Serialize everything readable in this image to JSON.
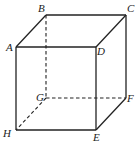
{
  "diagram": {
    "type": "cube",
    "vertices": {
      "A": {
        "x": 16,
        "y": 47,
        "label": "A",
        "lx": 6,
        "ly": 51
      },
      "B": {
        "x": 46,
        "y": 15,
        "label": "B",
        "lx": 38,
        "ly": 12
      },
      "C": {
        "x": 126,
        "y": 15,
        "label": "C",
        "lx": 127,
        "ly": 12
      },
      "D": {
        "x": 96,
        "y": 47,
        "label": "D",
        "lx": 97,
        "ly": 55
      },
      "E": {
        "x": 96,
        "y": 130,
        "label": "E",
        "lx": 93,
        "ly": 141
      },
      "F": {
        "x": 126,
        "y": 98,
        "label": "F",
        "lx": 127,
        "ly": 102
      },
      "G": {
        "x": 46,
        "y": 98,
        "label": "G",
        "lx": 36,
        "ly": 101
      },
      "H": {
        "x": 16,
        "y": 130,
        "label": "H",
        "lx": 3,
        "ly": 137
      }
    },
    "solid_edges": [
      [
        "A",
        "B"
      ],
      [
        "B",
        "C"
      ],
      [
        "C",
        "D"
      ],
      [
        "D",
        "A"
      ],
      [
        "A",
        "H"
      ],
      [
        "D",
        "E"
      ],
      [
        "C",
        "F"
      ],
      [
        "H",
        "E"
      ],
      [
        "E",
        "F"
      ]
    ],
    "hidden_edges": [
      [
        "B",
        "G"
      ],
      [
        "G",
        "F"
      ],
      [
        "G",
        "H"
      ]
    ]
  }
}
